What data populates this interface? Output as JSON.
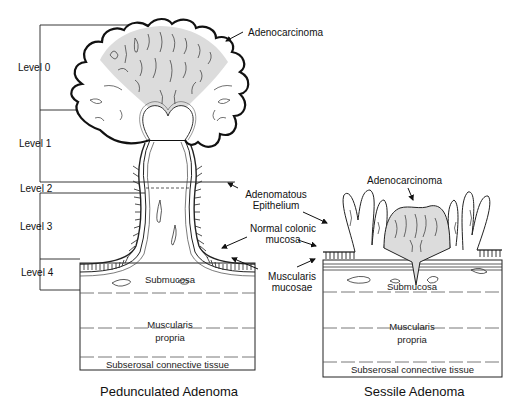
{
  "levels": [
    {
      "label": "Level 0"
    },
    {
      "label": "Level 1"
    },
    {
      "label": "Level 2"
    },
    {
      "label": "Level 3"
    },
    {
      "label": "Level 4"
    }
  ],
  "pedunculated": {
    "caption": "Pedunculated Adenoma",
    "adenocarcinoma_label": "Adenocarcinoma",
    "layers": {
      "submucosa": "Submucosa",
      "muscularis_line1": "Muscularis",
      "muscularis_line2": "propria",
      "subserosal": "Subserosal connective tissue"
    }
  },
  "middle_labels": {
    "adenomatous_line1": "Adenomatous",
    "adenomatous_line2": "Epithelium",
    "normal_line1": "Normal colonic",
    "normal_line2": "mucosa",
    "muscularis_line1": "Muscularis",
    "muscularis_line2": "mucosae"
  },
  "sessile": {
    "caption": "Sessile Adenoma",
    "adenocarcinoma_label": "Adenocarcinoma",
    "layers": {
      "submucosa": "Submucosa",
      "muscularis_line1": "Muscularis",
      "muscularis_line2": "propria",
      "subserosal": "Subserosal connective tissue"
    }
  },
  "colors": {
    "ink": "#111111",
    "tumor_shade": "#d9d9d9",
    "background": "#ffffff"
  }
}
